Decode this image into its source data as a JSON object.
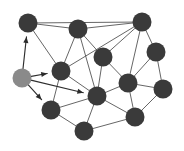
{
  "figure": {
    "width": 184,
    "height": 151,
    "background_color": "#ffffff"
  },
  "style": {
    "node_color_default": "#3a3a3a",
    "node_color_highlight": "#8a8a8a",
    "node_radius": 9.5,
    "edge_color": "#555555",
    "edge_color_directed": "#2e2e2e",
    "arrow_color": "#2b2b2b"
  },
  "graph_data": {
    "type": "node-link-diagram",
    "node_count": 13,
    "edge_count": 26,
    "directed_edge_count": 4,
    "nodes": [
      {
        "id": "n1",
        "label": "1",
        "x": 28,
        "y": 23,
        "state": "visited",
        "color": "#3a3a3a"
      },
      {
        "id": "n2",
        "label": "2",
        "x": 78,
        "y": 29,
        "state": "visited",
        "color": "#3a3a3a"
      },
      {
        "id": "n3",
        "label": "3",
        "x": 142,
        "y": 22,
        "state": "visited",
        "color": "#3a3a3a"
      },
      {
        "id": "n4",
        "label": "4",
        "x": 156,
        "y": 52,
        "state": "visited",
        "color": "#3a3a3a"
      },
      {
        "id": "n5",
        "label": "5",
        "x": 103,
        "y": 57,
        "state": "visited",
        "color": "#3a3a3a"
      },
      {
        "id": "n6",
        "label": "6",
        "x": 61,
        "y": 71,
        "state": "visited",
        "color": "#3a3a3a"
      },
      {
        "id": "n7",
        "label": "7",
        "x": 22,
        "y": 78,
        "state": "highlight",
        "color": "#8a8a8a"
      },
      {
        "id": "n8",
        "label": "8",
        "x": 128,
        "y": 83,
        "state": "visited",
        "color": "#3a3a3a"
      },
      {
        "id": "n9",
        "label": "9",
        "x": 163,
        "y": 89,
        "state": "visited",
        "color": "#3a3a3a"
      },
      {
        "id": "n10",
        "label": "10",
        "x": 97,
        "y": 96,
        "state": "visited",
        "color": "#3a3a3a"
      },
      {
        "id": "n11",
        "label": "11",
        "x": 51,
        "y": 110,
        "state": "visited",
        "color": "#3a3a3a"
      },
      {
        "id": "n12",
        "label": "12",
        "x": 135,
        "y": 117,
        "state": "visited",
        "color": "#3a3a3a"
      },
      {
        "id": "n13",
        "label": "13",
        "x": 84,
        "y": 131,
        "state": "visited",
        "color": "#3a3a3a"
      }
    ],
    "edges": [
      {
        "source": "n1",
        "target": "n2",
        "directed": false
      },
      {
        "source": "n1",
        "target": "n3",
        "directed": false
      },
      {
        "source": "n1",
        "target": "n6",
        "directed": false
      },
      {
        "source": "n2",
        "target": "n3",
        "directed": false
      },
      {
        "source": "n2",
        "target": "n6",
        "directed": false
      },
      {
        "source": "n2",
        "target": "n5",
        "directed": false
      },
      {
        "source": "n2",
        "target": "n10",
        "directed": false
      },
      {
        "source": "n3",
        "target": "n5",
        "directed": false
      },
      {
        "source": "n3",
        "target": "n6",
        "directed": false
      },
      {
        "source": "n3",
        "target": "n4",
        "directed": false
      },
      {
        "source": "n3",
        "target": "n8",
        "directed": false
      },
      {
        "source": "n4",
        "target": "n8",
        "directed": false
      },
      {
        "source": "n4",
        "target": "n9",
        "directed": false
      },
      {
        "source": "n5",
        "target": "n8",
        "directed": false
      },
      {
        "source": "n5",
        "target": "n10",
        "directed": false
      },
      {
        "source": "n6",
        "target": "n10",
        "directed": false
      },
      {
        "source": "n6",
        "target": "n11",
        "directed": false
      },
      {
        "source": "n8",
        "target": "n9",
        "directed": false
      },
      {
        "source": "n8",
        "target": "n10",
        "directed": false
      },
      {
        "source": "n8",
        "target": "n12",
        "directed": false
      },
      {
        "source": "n9",
        "target": "n12",
        "directed": false
      },
      {
        "source": "n10",
        "target": "n11",
        "directed": false
      },
      {
        "source": "n10",
        "target": "n12",
        "directed": false
      },
      {
        "source": "n10",
        "target": "n13",
        "directed": false
      },
      {
        "source": "n11",
        "target": "n13",
        "directed": false
      },
      {
        "source": "n12",
        "target": "n13",
        "directed": false
      },
      {
        "source": "n7",
        "target": "n1",
        "directed": true
      },
      {
        "source": "n7",
        "target": "n6",
        "directed": true
      },
      {
        "source": "n7",
        "target": "n11",
        "directed": true
      },
      {
        "source": "n7",
        "target": "n10",
        "directed": true
      }
    ]
  }
}
